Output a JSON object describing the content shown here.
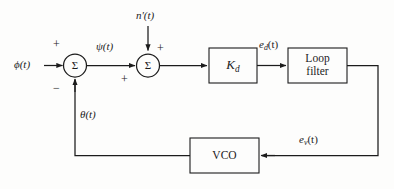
{
  "diagram": {
    "stroke_color": "#1c1c1c",
    "background_color": "#fdfdfc",
    "signals": {
      "input": "ϕ(t)",
      "error": "ψ(t)",
      "noise": "n'(t)",
      "detector_out": "e",
      "detector_out_sub": "d",
      "detector_out_tail": "(t)",
      "vco_in": "e",
      "vco_in_sub": "v",
      "vco_in_tail": "(t)",
      "feedback": "θ(t)"
    },
    "blocks": [
      {
        "name": "phase-detector-gain",
        "label": "K",
        "label_sub": "d"
      },
      {
        "name": "loop-filter",
        "label": "Loop\nfilter"
      },
      {
        "name": "vco",
        "label": "VCO"
      }
    ],
    "summers": [
      {
        "name": "input-summer",
        "symbol": "Σ",
        "signs": [
          {
            "value": "+",
            "position": "top-left"
          },
          {
            "value": "−",
            "position": "bottom-left"
          }
        ]
      },
      {
        "name": "noise-summer",
        "symbol": "Σ",
        "signs": [
          {
            "value": "+",
            "position": "top-right"
          },
          {
            "value": "+",
            "position": "bottom-left"
          }
        ]
      }
    ]
  }
}
